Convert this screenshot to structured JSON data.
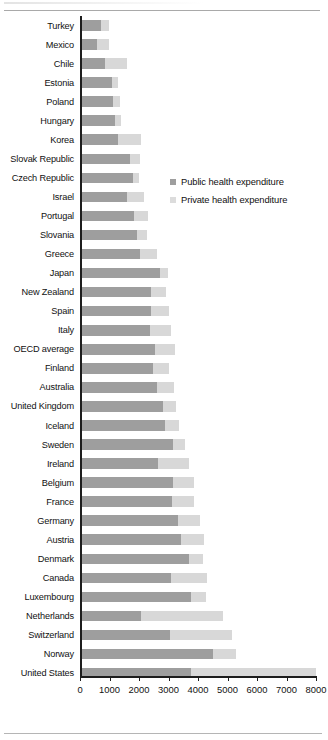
{
  "chart_data": {
    "type": "bar",
    "orientation": "horizontal",
    "stacked": true,
    "title": "",
    "xlabel": "",
    "ylabel": "",
    "xlim": [
      0,
      8000
    ],
    "xticks": [
      0,
      1000,
      2000,
      3000,
      4000,
      5000,
      6000,
      7000,
      8000
    ],
    "xtick_labels": [
      "0",
      "1000",
      "2000",
      "3000",
      "4000",
      "5000",
      "6000",
      "7000",
      "8000"
    ],
    "grid": false,
    "legend_position": "upper-center-right",
    "categories": [
      "Turkey",
      "Mexico",
      "Chile",
      "Estonia",
      "Poland",
      "Hungary",
      "Korea",
      "Slovak Republic",
      "Czech Republic",
      "Israel",
      "Portugal",
      "Slovania",
      "Greece",
      "Japan",
      "New Zealand",
      "Spain",
      "Italy",
      "OECD average",
      "Finland",
      "Australia",
      "United Kingdom",
      "Iceland",
      "Sweden",
      "Ireland",
      "Belgium",
      "France",
      "Germany",
      "Austria",
      "Denmark",
      "Canada",
      "Luxembourg",
      "Netherlands",
      "Switzerland",
      "Norway",
      "United States"
    ],
    "series": [
      {
        "name": "Public health expenditure",
        "color": "#9e9e9e",
        "values": [
          700,
          560,
          860,
          1080,
          1130,
          1200,
          1300,
          1700,
          1780,
          1580,
          1820,
          1920,
          2050,
          2700,
          2390,
          2400,
          2360,
          2530,
          2460,
          2600,
          2800,
          2890,
          3150,
          2640,
          3150,
          3130,
          3330,
          3430,
          3700,
          3080,
          3760,
          2060,
          3040,
          4500,
          3750
        ]
      },
      {
        "name": "Private health expenditure",
        "color": "#d8d8d8",
        "values": [
          300,
          420,
          730,
          200,
          230,
          190,
          760,
          350,
          230,
          590,
          500,
          360,
          550,
          290,
          510,
          620,
          730,
          690,
          560,
          580,
          460,
          470,
          410,
          1050,
          730,
          740,
          740,
          760,
          470,
          1220,
          520,
          2800,
          2110,
          780,
          4250
        ]
      }
    ],
    "totals": [
      1000,
      980,
      1590,
      1280,
      1360,
      1390,
      2060,
      2050,
      2010,
      2170,
      2320,
      2280,
      2600,
      2990,
      2900,
      3020,
      3090,
      3220,
      3020,
      3180,
      3260,
      3360,
      3560,
      3690,
      3880,
      3870,
      4070,
      4190,
      4170,
      4300,
      4280,
      4860,
      5150,
      5280,
      8000
    ]
  },
  "legend": {
    "items": [
      {
        "label": "Public health expenditure",
        "color": "#9e9e9e",
        "swatch": "square-swatch-public"
      },
      {
        "label": "Private health expenditure",
        "color": "#d8d8d8",
        "swatch": "square-swatch-private"
      }
    ]
  }
}
